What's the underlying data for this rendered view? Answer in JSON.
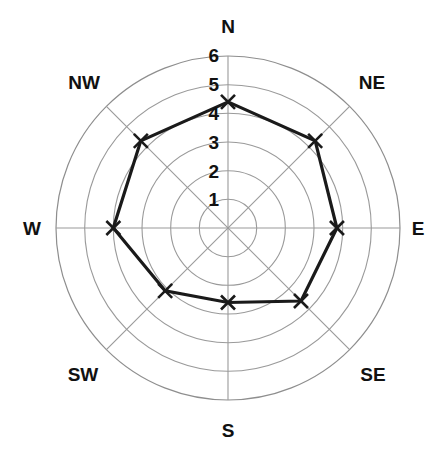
{
  "chart_data": {
    "type": "line",
    "subtype": "polar-radar",
    "title": "",
    "xlabel": "",
    "ylabel": "",
    "categories": [
      "N",
      "NE",
      "E",
      "SE",
      "S",
      "SW",
      "W",
      "NW"
    ],
    "angles_deg": [
      0,
      45,
      90,
      135,
      180,
      225,
      270,
      315
    ],
    "values": [
      4.4,
      4.3,
      3.8,
      3.6,
      2.6,
      3.1,
      4.0,
      4.3
    ],
    "series": [
      {
        "name": "",
        "values": [
          4.4,
          4.3,
          3.8,
          3.6,
          2.6,
          3.1,
          4.0,
          4.3
        ],
        "closed": true,
        "marker": "x",
        "line_color": "#1a1a1a",
        "line_width": 3.2
      }
    ],
    "rlim": [
      0,
      6
    ],
    "r_ticks": [
      1,
      2,
      3,
      4,
      5,
      6
    ],
    "r_tick_labels": [
      "1",
      "2",
      "3",
      "4",
      "5",
      "6"
    ],
    "r_tick_angle_deg": 0,
    "grid": true,
    "grid_color": "#9a9a9a",
    "legend": false,
    "legend_position": "none",
    "background": "#ffffff"
  },
  "axes": {
    "direction_labels": [
      {
        "key": "n",
        "text": "N"
      },
      {
        "key": "ne",
        "text": "NE"
      },
      {
        "key": "e",
        "text": "E"
      },
      {
        "key": "se",
        "text": "SE"
      },
      {
        "key": "s",
        "text": "S"
      },
      {
        "key": "sw",
        "text": "SW"
      },
      {
        "key": "w",
        "text": "W"
      },
      {
        "key": "nw",
        "text": "NW"
      }
    ],
    "radial_labels": [
      {
        "key": "r6",
        "text": "6"
      },
      {
        "key": "r5",
        "text": "5"
      },
      {
        "key": "r4",
        "text": "4"
      },
      {
        "key": "r3",
        "text": "3"
      },
      {
        "key": "r2",
        "text": "2"
      },
      {
        "key": "r1",
        "text": "1"
      }
    ]
  },
  "colors": {
    "series_line": "#1a1a1a",
    "grid": "#9a9a9a",
    "text": "#111111",
    "background": "#ffffff"
  }
}
